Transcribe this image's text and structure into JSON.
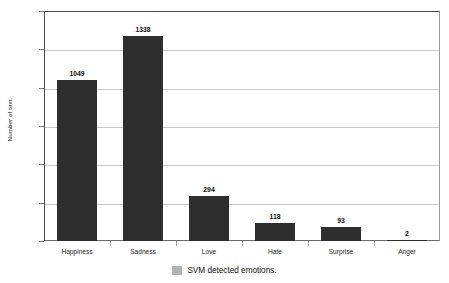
{
  "chart_data": {
    "type": "bar",
    "title": "",
    "subtitle": "",
    "xlabel": "",
    "ylabel": "Number of text.",
    "categories": [
      "Happiness",
      "Sadness",
      "Love",
      "Hate",
      "Surprise",
      "Anger"
    ],
    "values": [
      1049,
      1338,
      294,
      118,
      93,
      2
    ],
    "value_labels": [
      "1049",
      "1338",
      "294",
      "118",
      "93",
      "2"
    ],
    "ylim": [
      0,
      1500
    ],
    "ytick_values": [
      0,
      250,
      500,
      750,
      1000,
      1250,
      1500
    ],
    "ytick_labels": [
      "0",
      "250",
      "500",
      "750",
      "1000",
      "1250",
      "1500"
    ],
    "grid": true,
    "grid_axis": "y",
    "legend": {
      "position": "bottom",
      "entries": [
        {
          "label": "SVM detected emotions.",
          "color": "#b4b4b4"
        }
      ]
    },
    "series": [
      {
        "name": "SVM detected emotions.",
        "color": "#2e2e2e",
        "values": [
          1049,
          1338,
          294,
          118,
          93,
          2
        ]
      }
    ]
  },
  "colors": {
    "bar": "#2e2e2e",
    "legend_swatch": "#b4b4b4",
    "gridline": "#c9c9c9",
    "axis": "#4a4a4a",
    "background": "#ffffff",
    "text": "#1a1a1a"
  }
}
